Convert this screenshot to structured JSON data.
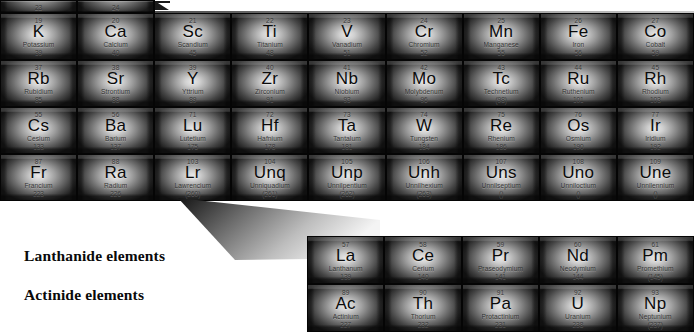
{
  "figure": {
    "kind": "periodic-table-excerpt",
    "series_labels": {
      "lanthanide": "Lanthanide elements",
      "actinide": "Actinide elements"
    }
  },
  "main_table": {
    "columns": 9,
    "rows": [
      {
        "id": "row-partial-top",
        "partial": true,
        "cells": [
          {
            "number": "11",
            "symbol": "Na",
            "name": "Sodium",
            "mass": "23"
          },
          {
            "number": "12",
            "symbol": "Mg",
            "name": "Magnesium",
            "mass": "24"
          },
          {
            "number": "",
            "symbol": "",
            "name": "",
            "mass": ""
          },
          {
            "number": "",
            "symbol": "",
            "name": "",
            "mass": ""
          },
          {
            "number": "",
            "symbol": "",
            "name": "",
            "mass": ""
          },
          {
            "number": "",
            "symbol": "",
            "name": "",
            "mass": ""
          },
          {
            "number": "",
            "symbol": "",
            "name": "",
            "mass": ""
          },
          {
            "number": "",
            "symbol": "",
            "name": "",
            "mass": ""
          },
          {
            "number": "",
            "symbol": "",
            "name": "",
            "mass": ""
          }
        ]
      },
      {
        "id": "row-period-4",
        "partial": false,
        "cells": [
          {
            "number": "19",
            "symbol": "K",
            "name": "Potassium",
            "mass": "39"
          },
          {
            "number": "20",
            "symbol": "Ca",
            "name": "Calcium",
            "mass": "40"
          },
          {
            "number": "21",
            "symbol": "Sc",
            "name": "Scandium",
            "mass": "45"
          },
          {
            "number": "22",
            "symbol": "Ti",
            "name": "Titanium",
            "mass": "48"
          },
          {
            "number": "23",
            "symbol": "V",
            "name": "Vanadium",
            "mass": "51"
          },
          {
            "number": "24",
            "symbol": "Cr",
            "name": "Chromium",
            "mass": "52"
          },
          {
            "number": "25",
            "symbol": "Mn",
            "name": "Manganese",
            "mass": "55"
          },
          {
            "number": "26",
            "symbol": "Fe",
            "name": "Iron",
            "mass": "56"
          },
          {
            "number": "27",
            "symbol": "Co",
            "name": "Cobalt",
            "mass": "59"
          }
        ]
      },
      {
        "id": "row-period-5",
        "partial": false,
        "cells": [
          {
            "number": "37",
            "symbol": "Rb",
            "name": "Rubidium",
            "mass": "85"
          },
          {
            "number": "38",
            "symbol": "Sr",
            "name": "Strontium",
            "mass": "88"
          },
          {
            "number": "39",
            "symbol": "Y",
            "name": "Yttrium",
            "mass": "89"
          },
          {
            "number": "40",
            "symbol": "Zr",
            "name": "Zirconium",
            "mass": "91"
          },
          {
            "number": "41",
            "symbol": "Nb",
            "name": "Niobium",
            "mass": "93"
          },
          {
            "number": "42",
            "symbol": "Mo",
            "name": "Molybdenum",
            "mass": "96"
          },
          {
            "number": "43",
            "symbol": "Tc",
            "name": "Technetium",
            "mass": "(98)"
          },
          {
            "number": "44",
            "symbol": "Ru",
            "name": "Ruthenium",
            "mass": "101"
          },
          {
            "number": "45",
            "symbol": "Rh",
            "name": "Rhodium",
            "mass": "103"
          }
        ]
      },
      {
        "id": "row-period-6",
        "partial": false,
        "cells": [
          {
            "number": "55",
            "symbol": "Cs",
            "name": "Cesium",
            "mass": "133"
          },
          {
            "number": "56",
            "symbol": "Ba",
            "name": "Barium",
            "mass": "137"
          },
          {
            "number": "71",
            "symbol": "Lu",
            "name": "Lutetium",
            "mass": "175"
          },
          {
            "number": "72",
            "symbol": "Hf",
            "name": "Hafnium",
            "mass": "178"
          },
          {
            "number": "73",
            "symbol": "Ta",
            "name": "Tantalum",
            "mass": "181"
          },
          {
            "number": "74",
            "symbol": "W",
            "name": "Tungsten",
            "mass": "184"
          },
          {
            "number": "75",
            "symbol": "Re",
            "name": "Rhenium",
            "mass": "186"
          },
          {
            "number": "76",
            "symbol": "Os",
            "name": "Osmium",
            "mass": "190"
          },
          {
            "number": "77",
            "symbol": "Ir",
            "name": "Iridium",
            "mass": "192"
          }
        ]
      },
      {
        "id": "row-period-7",
        "partial": false,
        "cells": [
          {
            "number": "87",
            "symbol": "Fr",
            "name": "Francium",
            "mass": "223"
          },
          {
            "number": "88",
            "symbol": "Ra",
            "name": "Radium",
            "mass": "226"
          },
          {
            "number": "103",
            "symbol": "Lr",
            "name": "Lawrencium",
            "mass": "(260)"
          },
          {
            "number": "104",
            "symbol": "Unq",
            "name": "Unniquadium",
            "mass": "(261)"
          },
          {
            "number": "105",
            "symbol": "Unp",
            "name": "Unnilpentium",
            "mass": "(262)"
          },
          {
            "number": "106",
            "symbol": "Unh",
            "name": "Unnilhexium",
            "mass": "(263)"
          },
          {
            "number": "107",
            "symbol": "Uns",
            "name": "Unnilseptium",
            "mass": "()"
          },
          {
            "number": "108",
            "symbol": "Uno",
            "name": "Unniloctium",
            "mass": "()"
          },
          {
            "number": "109",
            "symbol": "Une",
            "name": "Unnilennium",
            "mass": "()"
          }
        ]
      }
    ]
  },
  "f_block": {
    "columns": 5,
    "rows": [
      {
        "id": "row-lanthanides",
        "cells": [
          {
            "number": "57",
            "symbol": "La",
            "name": "Lanthanum",
            "mass": "139"
          },
          {
            "number": "58",
            "symbol": "Ce",
            "name": "Cerium",
            "mass": "140"
          },
          {
            "number": "59",
            "symbol": "Pr",
            "name": "Praseodymium",
            "mass": "141"
          },
          {
            "number": "60",
            "symbol": "Nd",
            "name": "Neodymium",
            "mass": "144"
          },
          {
            "number": "61",
            "symbol": "Pm",
            "name": "Promethium",
            "mass": "(145)"
          }
        ]
      },
      {
        "id": "row-actinides",
        "cells": [
          {
            "number": "89",
            "symbol": "Ac",
            "name": "Actinium",
            "mass": "227"
          },
          {
            "number": "90",
            "symbol": "Th",
            "name": "Thorium",
            "mass": "232"
          },
          {
            "number": "91",
            "symbol": "Pa",
            "name": "Protactinium",
            "mass": "231"
          },
          {
            "number": "92",
            "symbol": "U",
            "name": "Uranium",
            "mass": "238"
          },
          {
            "number": "93",
            "symbol": "Np",
            "name": "Neptunium",
            "mass": "(237)"
          }
        ]
      }
    ]
  },
  "colors": {
    "cell_highlight": "#e9e9e9",
    "cell_shadow": "#1b1b1b",
    "grid_line": "#050505",
    "page_background": "#ffffff",
    "text": "#0b0b0b"
  }
}
